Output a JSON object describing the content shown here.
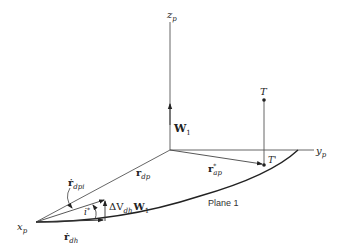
{
  "figure": {
    "axes": {
      "z": {
        "base": "z",
        "sub": "p"
      },
      "y": {
        "base": "y",
        "sub": "p"
      },
      "x": {
        "base": "x",
        "sub": "p"
      }
    },
    "points": {
      "target": "T",
      "target_projection": "T'"
    },
    "vectors": {
      "w1": {
        "base": "W",
        "sub": "1"
      },
      "r_dp": {
        "base": "r",
        "sub": "dp"
      },
      "r_ap_star": {
        "base": "r",
        "sup": "*",
        "sub": "ap"
      },
      "r_dot_dpi": {
        "base": "ṙ",
        "sub": "dpi"
      },
      "r_dot_dh": {
        "base": "ṙ",
        "sub": "dh"
      },
      "delta_v": {
        "prefix": "ΔV",
        "sub": "dh",
        "vec": "W",
        "vec_sub": "1"
      }
    },
    "angle_label": {
      "base": "i",
      "sup": "*"
    },
    "plane_label": "Plane 1",
    "colors": {
      "line": "#444444",
      "curve": "#222222",
      "text": "#222222"
    }
  }
}
